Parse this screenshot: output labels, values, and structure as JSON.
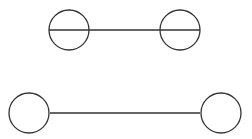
{
  "diagram": {
    "type": "visual-illusion",
    "stroke_color": "#333333",
    "background": "#ffffff",
    "figures": [
      {
        "name": "top-figure",
        "line": {
          "x1": 49,
          "y1": 30,
          "x2": 200,
          "y2": 30
        },
        "circles": [
          {
            "cx": 69,
            "cy": 30,
            "r": 20
          },
          {
            "cx": 180,
            "cy": 30,
            "r": 20
          }
        ]
      },
      {
        "name": "bottom-figure",
        "line": {
          "x1": 50,
          "y1": 113,
          "x2": 200,
          "y2": 113
        },
        "circles": [
          {
            "cx": 29,
            "cy": 113,
            "r": 20
          },
          {
            "cx": 221,
            "cy": 113,
            "r": 20
          }
        ]
      }
    ]
  }
}
